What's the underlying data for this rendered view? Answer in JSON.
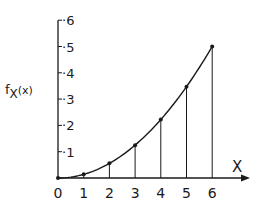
{
  "chart_data": {
    "type": "line",
    "title": "",
    "xlabel": "X",
    "ylabel": "fX(x)",
    "ylabel_main": "f",
    "ylabel_sub": "X",
    "ylabel_arg": "(x)",
    "x": [
      0,
      1,
      2,
      3,
      4,
      5,
      6
    ],
    "series": [
      {
        "name": "fX(x)",
        "values": [
          0,
          0.014,
          0.056,
          0.125,
          0.222,
          0.347,
          0.5
        ],
        "markers": true,
        "stems": true,
        "smooth_curve": true
      }
    ],
    "x_ticks": [
      "0",
      "1",
      "2",
      "3",
      "4",
      "5",
      "6"
    ],
    "y_ticks": [
      "·1",
      "·2",
      "·3",
      "·4",
      "·5",
      "·6"
    ],
    "y_tick_values": [
      0.1,
      0.2,
      0.3,
      0.4,
      0.5,
      0.6
    ],
    "xlim": [
      0,
      6.9
    ],
    "ylim": [
      0,
      0.6
    ],
    "grid": false,
    "legend": null
  }
}
